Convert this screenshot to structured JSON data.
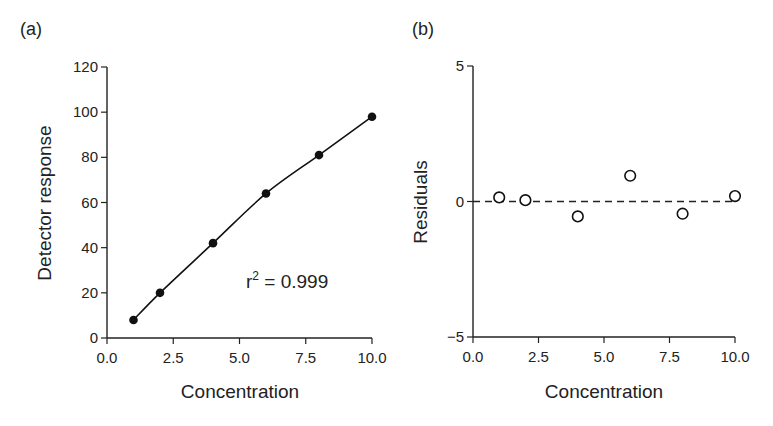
{
  "chart_data": [
    {
      "type": "line",
      "panel_label": "(a)",
      "title": "",
      "xlabel": "Concentration",
      "ylabel": "Detector response",
      "xlim": [
        0,
        10
      ],
      "ylim": [
        0,
        120
      ],
      "xticks": [
        "0.0",
        "2.5",
        "5.0",
        "7.5",
        "10.0"
      ],
      "yticks": [
        "0",
        "20",
        "40",
        "60",
        "80",
        "100",
        "120"
      ],
      "grid": false,
      "legend": null,
      "annotation": {
        "prefix": "r",
        "sup": "2",
        "suffix": " = 0.999"
      },
      "series": [
        {
          "name": "Calibration data",
          "marker": "filled-circle",
          "line": "smooth-fit",
          "x": [
            1,
            2,
            4,
            6,
            8,
            10
          ],
          "y": [
            8,
            20,
            42,
            64,
            81,
            98
          ]
        }
      ]
    },
    {
      "type": "scatter",
      "panel_label": "(b)",
      "title": "",
      "xlabel": "Concentration",
      "ylabel": "Residuals",
      "xlim": [
        0,
        10
      ],
      "ylim": [
        -5,
        5
      ],
      "xticks": [
        "0.0",
        "2.5",
        "5.0",
        "7.5",
        "10.0"
      ],
      "yticks": [
        "-5",
        "0",
        "5"
      ],
      "ytick_labels": [
        "−5",
        "0",
        "5"
      ],
      "grid": false,
      "legend": null,
      "reference_line": {
        "y": 0,
        "style": "dashed"
      },
      "series": [
        {
          "name": "Residuals",
          "marker": "open-circle",
          "x": [
            1,
            2,
            4,
            6,
            8,
            10
          ],
          "y": [
            0.15,
            0.05,
            -0.55,
            0.95,
            -0.45,
            0.2
          ]
        }
      ]
    }
  ]
}
